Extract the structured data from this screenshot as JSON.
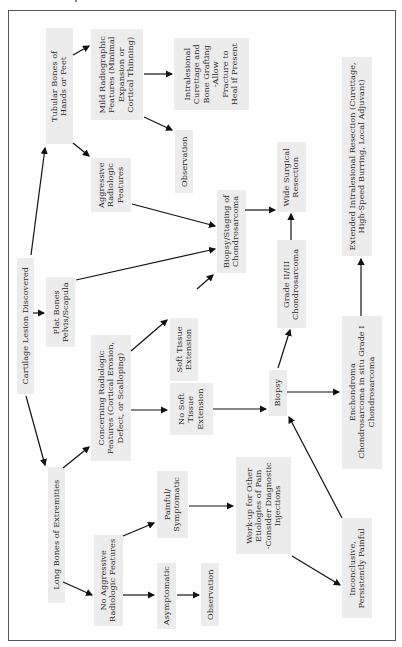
{
  "diagram": {
    "type": "flowchart",
    "orientation": "rotated-90-ccw",
    "colors": {
      "box_fill": "#ececec",
      "text": "#2a2a2a",
      "arrow": "#111111",
      "frame": "#555555"
    },
    "nodes": {
      "cartilage_lesion": "Cartilage Lesion Discovered",
      "tubular_bones": "Tubular Bones of\nHands or Feet",
      "flat_bones": "Flat Bones\nPelvis/Scapula",
      "long_bones": "Long Bones of Extremities",
      "mild_features": "Mild Radiographic\nFeatures (Minimal\nExpansion or\nCortical Thinning)",
      "aggressive_features": "Aggressive\nRadiologic\nFeatures",
      "concerning_features": "Concerning Radiologic\nFeatures (Cortical Erosion,\nDefect, or Scalloping)",
      "no_aggressive_features": "No Aggressive\nRadiologic Features",
      "intralesional_curettage": "Intralesional\nCurettage and\nBone Grafting\n-Allow\nFracture to\nHeal if Present",
      "observation_top": "Observation",
      "soft_tissue_ext": "Soft Tissue\nExtension",
      "no_soft_tissue_ext": "No Soft\nTissue\nExtension",
      "painful": "Painful/\nSymptomatic",
      "asymptomatic": "Asymptomatic",
      "observation_bottom": "Observation",
      "biopsy_staging": "Biopsy/Staging of\nChondrosarcoma",
      "wide_resection": "Wide Surgical\nResection",
      "grade_23": "Grade II/III\nChondrosarcoma",
      "biopsy": "Biopsy",
      "workup": "Work-up for Other\nEtiologies of Pain\n-Consider Diagnostic\nInjections",
      "extended_resection": "Extended Intralesional Resection (Curettage,\nHigh-Speed Burring, Local Adjuvant)",
      "enchondroma": "Enchondroma\nChondrosarcoma in situ Grade I\nChondrosarcoma",
      "inconclusive": "Inconclusive,\nPersistently Painful"
    },
    "edges": [
      [
        "cartilage_lesion",
        "tubular_bones"
      ],
      [
        "cartilage_lesion",
        "flat_bones"
      ],
      [
        "cartilage_lesion",
        "long_bones"
      ],
      [
        "tubular_bones",
        "mild_features"
      ],
      [
        "tubular_bones",
        "aggressive_features"
      ],
      [
        "mild_features",
        "intralesional_curettage"
      ],
      [
        "mild_features",
        "observation_top"
      ],
      [
        "aggressive_features",
        "biopsy_staging"
      ],
      [
        "flat_bones",
        "biopsy_staging"
      ],
      [
        "long_bones",
        "concerning_features"
      ],
      [
        "long_bones",
        "no_aggressive_features"
      ],
      [
        "concerning_features",
        "soft_tissue_ext"
      ],
      [
        "concerning_features",
        "no_soft_tissue_ext"
      ],
      [
        "soft_tissue_ext",
        "biopsy_staging"
      ],
      [
        "biopsy_staging",
        "wide_resection"
      ],
      [
        "no_soft_tissue_ext",
        "biopsy"
      ],
      [
        "biopsy",
        "grade_23"
      ],
      [
        "grade_23",
        "wide_resection"
      ],
      [
        "biopsy",
        "enchondroma"
      ],
      [
        "enchondroma",
        "extended_resection"
      ],
      [
        "no_aggressive_features",
        "painful"
      ],
      [
        "no_aggressive_features",
        "asymptomatic"
      ],
      [
        "asymptomatic",
        "observation_bottom"
      ],
      [
        "painful",
        "workup"
      ],
      [
        "workup",
        "inconclusive"
      ],
      [
        "inconclusive",
        "biopsy"
      ]
    ]
  }
}
